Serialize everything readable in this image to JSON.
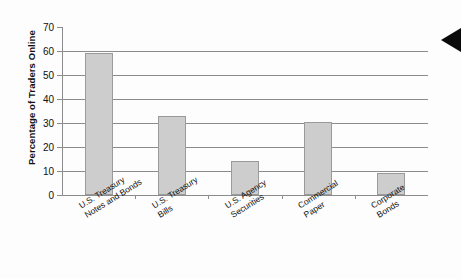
{
  "chart_data": {
    "type": "bar",
    "title": "",
    "xlabel": "",
    "ylabel": "Percentage of Traders Online",
    "ylim": [
      0,
      70
    ],
    "yticks": [
      0,
      10,
      20,
      30,
      40,
      50,
      60,
      70
    ],
    "grid": true,
    "legend": null,
    "categories": [
      "U.S. Treasury\nNotes and Bonds",
      "U.S. Treasury\nBills",
      "U.S. Agency\nSecurities",
      "Commercial\nPaper",
      "Corporate\nBonds"
    ],
    "values": [
      59,
      33,
      14,
      30.5,
      9
    ],
    "bar_color": "#cdcdcd",
    "bar_edge_color": "#9a9a9a",
    "axis_color": "#8c8c8c"
  },
  "annotations": {
    "marker_icon": "left-pointing-triangle",
    "marker_color": "#0a0a0a"
  }
}
